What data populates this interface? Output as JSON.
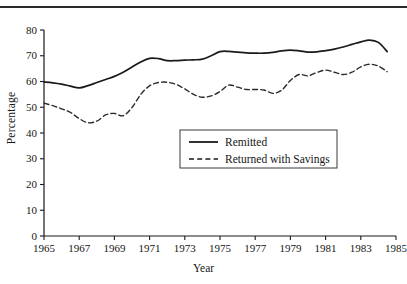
{
  "page": {
    "top_sliver_text": "· · · · ·",
    "rule": "horizontal-rule"
  },
  "chart_data": {
    "type": "line",
    "title": "",
    "xlabel": "Year",
    "ylabel": "Percentage",
    "xlim": [
      1965,
      1985
    ],
    "ylim": [
      0,
      80
    ],
    "ytick_values": [
      0,
      10,
      20,
      30,
      40,
      50,
      60,
      70,
      80
    ],
    "ytick_labels": [
      "0",
      "10",
      "20",
      "30",
      "40",
      "50",
      "60",
      "70",
      "80"
    ],
    "xtick_values": [
      1965,
      1967,
      1969,
      1971,
      1973,
      1975,
      1977,
      1979,
      1981,
      1983,
      1985
    ],
    "xtick_labels": [
      "1965",
      "1967",
      "1969",
      "1971",
      "1973",
      "1975",
      "1977",
      "1979",
      "1981",
      "1983",
      "1985"
    ],
    "grid": false,
    "legend_position": "center",
    "x": [
      1965,
      1965.5,
      1966,
      1966.5,
      1967,
      1967.5,
      1968,
      1968.5,
      1969,
      1969.5,
      1970,
      1970.5,
      1971,
      1971.5,
      1972,
      1972.5,
      1973,
      1973.5,
      1974,
      1974.5,
      1975,
      1975.5,
      1976,
      1976.5,
      1977,
      1977.5,
      1978,
      1978.5,
      1979,
      1979.5,
      1980,
      1980.5,
      1981,
      1981.5,
      1982,
      1982.5,
      1983,
      1983.5,
      1984,
      1984.5
    ],
    "series": [
      {
        "name": "Remitted",
        "style": "solid",
        "color": "#1a1a1a",
        "values": [
          59.8,
          59.5,
          59.0,
          58.2,
          57.5,
          58.4,
          59.6,
          60.8,
          62.0,
          63.6,
          65.6,
          67.6,
          69.0,
          68.9,
          68.1,
          68.1,
          68.3,
          68.4,
          68.7,
          70.0,
          71.6,
          71.7,
          71.4,
          71.1,
          71.0,
          71.0,
          71.3,
          71.9,
          72.2,
          71.9,
          71.4,
          71.5,
          72.0,
          72.6,
          73.4,
          74.4,
          75.4,
          76.1,
          75.2,
          71.6
        ]
      },
      {
        "name": "Returned with Savings",
        "style": "dashed",
        "color": "#2b2b2b",
        "values": [
          51.6,
          50.6,
          49.4,
          48.0,
          45.6,
          44.0,
          44.6,
          47.0,
          47.6,
          46.7,
          49.9,
          55.0,
          58.3,
          59.6,
          59.7,
          58.9,
          57.1,
          55.0,
          53.9,
          54.4,
          56.1,
          58.6,
          57.8,
          56.9,
          56.9,
          56.7,
          55.4,
          56.6,
          60.4,
          62.7,
          62.2,
          63.5,
          64.4,
          63.6,
          62.7,
          63.6,
          65.7,
          66.7,
          66.0,
          63.8
        ]
      }
    ]
  },
  "legend": {
    "items": [
      {
        "label": "Remitted",
        "style": "solid"
      },
      {
        "label": "Returned with Savings",
        "style": "dashed"
      }
    ]
  }
}
